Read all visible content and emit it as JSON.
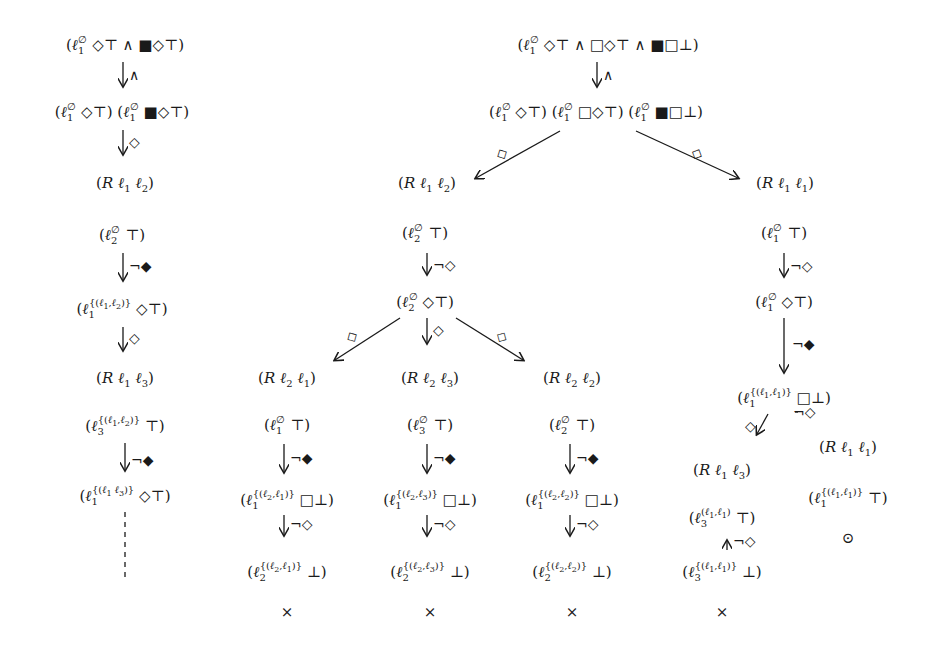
{
  "diagram": {
    "type": "tableau-proof-trees",
    "left_tree": {
      "nodes": [
        {
          "id": "L0",
          "text": "(ℓ₁^∅ ◇⊤ ∧ ■◇⊤)",
          "x": 125,
          "y": 40
        },
        {
          "id": "L1",
          "text": "(ℓ₁^∅ ◇⊤) (ℓ₁^∅ ■◇⊤)",
          "x": 122,
          "y": 107
        },
        {
          "id": "L2",
          "text": "(R ℓ₁ ℓ₂)",
          "x": 125,
          "y": 183
        },
        {
          "id": "L3",
          "text": "(ℓ₂^∅ ⊤)",
          "x": 122,
          "y": 230
        },
        {
          "id": "L4",
          "text": "(ℓ₁^{(ℓ₁,ℓ₂)} ◇⊤)",
          "x": 122,
          "y": 303
        },
        {
          "id": "L5",
          "text": "(R ℓ₁ ℓ₃)",
          "x": 125,
          "y": 378
        },
        {
          "id": "L6",
          "text": "(ℓ₃^{(ℓ₁,ℓ₂)} ⊤)",
          "x": 125,
          "y": 420
        },
        {
          "id": "L7",
          "text": "(ℓ₁^{(ℓ₁ ℓ₃)} ◇⊤)",
          "x": 125,
          "y": 490
        }
      ],
      "edges": [
        {
          "from": "L0",
          "to": "L1",
          "label": "∧"
        },
        {
          "from": "L1",
          "to": "L2",
          "label": "◇"
        },
        {
          "from": "L3",
          "to": "L4",
          "label": "¬◆"
        },
        {
          "from": "L4",
          "to": "L5",
          "label": "◇"
        },
        {
          "from": "L6",
          "to": "L7",
          "label": "¬◆"
        },
        {
          "from": "L7",
          "to": "continues",
          "label": "",
          "style": "dashed"
        }
      ]
    },
    "right_tree": {
      "nodes": [
        {
          "id": "R0",
          "text": "(ℓ₁^∅ ◇⊤ ∧ □◇⊤ ∧ ■□⊤)",
          "x": 608,
          "y": 40
        },
        {
          "id": "R1",
          "text": "(ℓ₁^∅ ◇⊤) (ℓ₁^∅ □◇⊤) (ℓ₁^∅ ■□⊥)",
          "x": 596,
          "y": 107
        },
        {
          "id": "A0",
          "text": "(R ℓ₁ ℓ₂)",
          "x": 427,
          "y": 183
        },
        {
          "id": "A1",
          "text": "(ℓ₂^∅ ⊤)",
          "x": 425,
          "y": 228
        },
        {
          "id": "A2",
          "text": "(ℓ₂^∅ ◇⊤)",
          "x": 425,
          "y": 297
        },
        {
          "id": "B0",
          "text": "(R ℓ₂ ℓ₁)",
          "x": 287,
          "y": 378
        },
        {
          "id": "B1",
          "text": "(ℓ₁^∅ ⊤)",
          "x": 287,
          "y": 420
        },
        {
          "id": "B2",
          "text": "(ℓ₁^{(ℓ₂,ℓ₁)} □⊥)",
          "x": 287,
          "y": 494
        },
        {
          "id": "B3",
          "text": "(ℓ₂^{(ℓ₂,ℓ₁)} ⊥)",
          "x": 287,
          "y": 566
        },
        {
          "id": "B4",
          "text": "×",
          "x": 287,
          "y": 612
        },
        {
          "id": "C0",
          "text": "(R ℓ₂ ℓ₃)",
          "x": 430,
          "y": 378
        },
        {
          "id": "C1",
          "text": "(ℓ₃^∅ ⊤)",
          "x": 430,
          "y": 420
        },
        {
          "id": "C2",
          "text": "(ℓ₁^{(ℓ₂,ℓ₃)} □⊥)",
          "x": 430,
          "y": 494
        },
        {
          "id": "C3",
          "text": "(ℓ₂^{(ℓ₂,ℓ₃)} ⊥)",
          "x": 430,
          "y": 566
        },
        {
          "id": "C4",
          "text": "×",
          "x": 430,
          "y": 612
        },
        {
          "id": "D0",
          "text": "(R ℓ₂ ℓ₂)",
          "x": 572,
          "y": 378
        },
        {
          "id": "D1",
          "text": "(ℓ₂^∅ ⊤)",
          "x": 572,
          "y": 420
        },
        {
          "id": "D2",
          "text": "(ℓ₁^{(ℓ₂,ℓ₂)} □⊥)",
          "x": 572,
          "y": 494
        },
        {
          "id": "D3",
          "text": "(ℓ₂^{(ℓ₂,ℓ₂)} ⊥)",
          "x": 572,
          "y": 566
        },
        {
          "id": "D4",
          "text": "×",
          "x": 572,
          "y": 612
        },
        {
          "id": "E0",
          "text": "(R ℓ₁ ℓ₁)",
          "x": 785,
          "y": 183
        },
        {
          "id": "E1",
          "text": "(ℓ₁^∅ ⊤)",
          "x": 784,
          "y": 228
        },
        {
          "id": "E2",
          "text": "(ℓ₁^∅ ◇⊤)",
          "x": 784,
          "y": 297
        },
        {
          "id": "E3",
          "text": "(ℓ₁^{(ℓ₁,ℓ₁)} □⊥)",
          "x": 784,
          "y": 392
        },
        {
          "id": "F0",
          "text": "(R ℓ₁ ℓ₃)",
          "x": 722,
          "y": 470
        },
        {
          "id": "F1",
          "text": "(ℓ₃^{(ℓ₁,ℓ₁)} ⊤)",
          "x": 722,
          "y": 512
        },
        {
          "id": "F2",
          "text": "(ℓ₃^{(ℓ₁,ℓ₁)} ⊥)",
          "x": 722,
          "y": 566
        },
        {
          "id": "F3",
          "text": "×",
          "x": 722,
          "y": 612
        },
        {
          "id": "G0",
          "text": "(R ℓ₁ ℓ₁)",
          "x": 848,
          "y": 447
        },
        {
          "id": "G1",
          "text": "(ℓ₁^{(ℓ₁,ℓ₁)} ⊤)",
          "x": 848,
          "y": 492
        },
        {
          "id": "G2",
          "text": "⊙",
          "x": 848,
          "y": 538
        }
      ],
      "edges": [
        {
          "from": "R0",
          "to": "R1",
          "label": "∧"
        },
        {
          "from": "R1",
          "to": "A0",
          "label": "◇"
        },
        {
          "from": "R1",
          "to": "E0",
          "label": "◇"
        },
        {
          "from": "A1",
          "to": "A2",
          "label": "¬◇"
        },
        {
          "from": "A2",
          "to": "B0",
          "label": "◇"
        },
        {
          "from": "A2",
          "to": "C0",
          "label": "◇"
        },
        {
          "from": "A2",
          "to": "D0",
          "label": "◇"
        },
        {
          "from": "B1",
          "to": "B2",
          "label": "¬◆"
        },
        {
          "from": "B2",
          "to": "B3",
          "label": "¬◇"
        },
        {
          "from": "C1",
          "to": "C2",
          "label": "¬◆"
        },
        {
          "from": "C2",
          "to": "C3",
          "label": "¬◇"
        },
        {
          "from": "D1",
          "to": "D2",
          "label": "¬◆"
        },
        {
          "from": "D2",
          "to": "D3",
          "label": "¬◇"
        },
        {
          "from": "E1",
          "to": "E2",
          "label": "¬◇"
        },
        {
          "from": "E2",
          "to": "E3",
          "label": "¬◆"
        },
        {
          "from": "E3",
          "to": "F0",
          "label": "◇"
        },
        {
          "from": "E3",
          "to": "G0",
          "label": "¬◇"
        },
        {
          "from": "F1",
          "to": "F2",
          "label": "¬◇"
        }
      ]
    }
  },
  "labels": {
    "and": "∧",
    "dia": "◇",
    "neg_dia": "¬◇",
    "neg_bdia": "¬◆",
    "cross": "×",
    "odot": "⊙"
  }
}
